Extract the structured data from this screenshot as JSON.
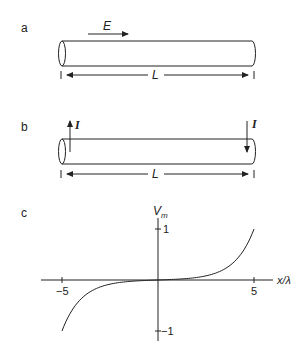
{
  "panels": {
    "a": {
      "label": "a",
      "field_label": "E",
      "length_label": "L"
    },
    "b": {
      "label": "b",
      "current_left_label": "I",
      "current_right_label": "I",
      "length_label": "L"
    },
    "c": {
      "label": "c",
      "y_axis_label_main": "V",
      "y_axis_label_sub": "m",
      "x_axis_label": "x/λ",
      "x_ticks": [
        "−5",
        "5"
      ],
      "y_ticks": [
        "1",
        "−1"
      ]
    }
  },
  "colors": {
    "stroke": "#222222",
    "background": "#ffffff"
  },
  "chart_data": {
    "type": "line",
    "title": "",
    "xlabel": "x/λ",
    "ylabel": "V_m",
    "xlim": [
      -5,
      5
    ],
    "ylim": [
      -1,
      1
    ],
    "x_ticks": [
      -5,
      5
    ],
    "y_ticks": [
      -1,
      1
    ],
    "grid": false,
    "series": [
      {
        "name": "V_m = sinh(x/λ)/sinh(5)",
        "x": [
          -5,
          -4.5,
          -4,
          -3.5,
          -3,
          -2.5,
          -2,
          -1.5,
          -1,
          -0.5,
          0,
          0.5,
          1,
          1.5,
          2,
          2.5,
          3,
          3.5,
          4,
          4.5,
          5
        ],
        "y": [
          -1.0,
          -0.607,
          -0.368,
          -0.223,
          -0.135,
          -0.081,
          -0.049,
          -0.029,
          -0.016,
          -0.007,
          0.0,
          0.007,
          0.016,
          0.029,
          0.049,
          0.081,
          0.135,
          0.223,
          0.368,
          0.607,
          1.0
        ]
      }
    ]
  }
}
